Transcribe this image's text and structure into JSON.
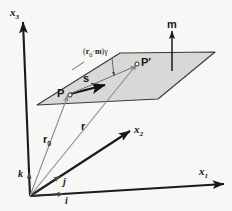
{
  "figure": {
    "background_color": "#f7f7f5",
    "plane_fill_color": "#d8d8d6",
    "plane_stroke_color": "#3a3a3a",
    "axis_color": "#1a1a1a",
    "thin_vector_color": "#8a8a8a",
    "bold_vector_color": "#111111"
  },
  "axes": [
    {
      "name": "x3-axis",
      "label": "x",
      "sub": "3"
    },
    {
      "name": "x2-axis",
      "label": "x",
      "sub": "2"
    },
    {
      "name": "x1-axis",
      "label": "x",
      "sub": "1"
    }
  ],
  "basis_vectors": [
    {
      "name": "k",
      "label": "k"
    },
    {
      "name": "j",
      "label": "j"
    },
    {
      "name": "i",
      "label": "i"
    }
  ],
  "points": [
    {
      "name": "P",
      "label": "P"
    },
    {
      "name": "P-prime",
      "label": "P′"
    }
  ],
  "vectors": [
    {
      "name": "s",
      "label": "s",
      "sub": ""
    },
    {
      "name": "r0",
      "label": "r",
      "sub": "0"
    },
    {
      "name": "r",
      "label": "r",
      "sub": ""
    },
    {
      "name": "m",
      "label": "m",
      "sub": ""
    }
  ],
  "annotations": [
    {
      "name": "distance-annotation",
      "open_paren": "(",
      "r_symbol": "r",
      "r_sub": "0",
      "dot": "·",
      "m_symbol": "m",
      "close_paren": ")",
      "gamma": "γ"
    }
  ]
}
